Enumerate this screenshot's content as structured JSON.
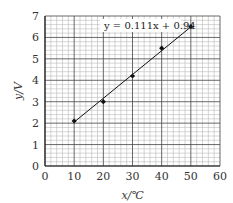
{
  "chart_data": {
    "type": "scatter",
    "title": "",
    "xlabel": "x/℃",
    "ylabel": "y/V",
    "xlim": [
      0,
      60
    ],
    "ylim": [
      0,
      7
    ],
    "xticks": [
      0,
      10,
      20,
      30,
      40,
      50,
      60
    ],
    "yticks": [
      0,
      1,
      2,
      3,
      4,
      5,
      6,
      7
    ],
    "grid": true,
    "minor_divisions": 5,
    "series": [
      {
        "name": "measured",
        "marker": "diamond",
        "x": [
          10,
          20,
          30,
          40,
          50
        ],
        "y": [
          2.1,
          3.0,
          4.2,
          5.5,
          6.5
        ]
      }
    ],
    "fit_line": {
      "equation": "y = 0.111x + 0.94",
      "slope": 0.111,
      "intercept": 0.94,
      "x_range": [
        10,
        50
      ]
    },
    "annotations": [
      {
        "text": "y = 0.111x + 0.94",
        "position": "top-right"
      }
    ]
  },
  "labels": {
    "xlabel_var": "x",
    "xlabel_unit": "/℃",
    "ylabel_var": "y",
    "ylabel_unit": "/V",
    "equation": "y = 0.111x + 0.94"
  },
  "colors": {
    "major_grid": "#444444",
    "minor_grid": "#bbbbbb",
    "data": "#111111"
  }
}
